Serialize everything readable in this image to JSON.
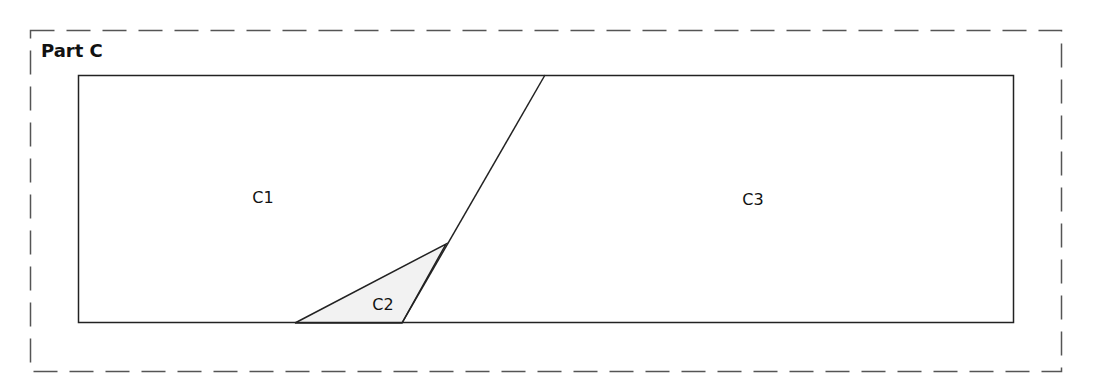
{
  "diagram": {
    "title": "Part C",
    "regions": [
      {
        "id": "C1",
        "label": "C1",
        "x": 263,
        "y": 197
      },
      {
        "id": "C2",
        "label": "C2",
        "x": 383,
        "y": 304,
        "fill": "#f2f2f2"
      },
      {
        "id": "C3",
        "label": "C3",
        "x": 753,
        "y": 199
      }
    ],
    "colors": {
      "line": "#222222",
      "dash": "#555555",
      "c2_fill": "#f2f2f2"
    }
  }
}
